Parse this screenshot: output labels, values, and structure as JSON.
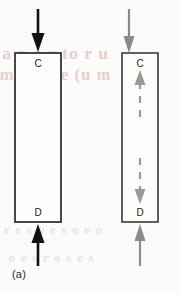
{
  "figure": {
    "background_color": "#fbfbfa",
    "panels": [
      {
        "id": "a",
        "caption": "(a)",
        "specimen": {
          "shape": "rectangle",
          "outline_color": "#1a1a1a",
          "fill_color": "#fdfdfc",
          "top_label": "C",
          "bottom_label": "D"
        },
        "load_arrows": [
          {
            "name": "top-load-arrow",
            "direction": "down",
            "color": "#111111",
            "style": "solid",
            "position": "above-specimen"
          },
          {
            "name": "bottom-load-arrow",
            "direction": "up",
            "color": "#111111",
            "style": "solid",
            "position": "below-specimen"
          }
        ],
        "internal_arrows": []
      },
      {
        "id": "b",
        "caption": "(b)",
        "specimen": {
          "shape": "rectangle",
          "outline_color": "#3a3a3a",
          "fill_color": "#fdfdfc",
          "top_label": "C",
          "bottom_label": "D"
        },
        "load_arrows": [
          {
            "name": "top-load-arrow",
            "direction": "down",
            "color": "#8a8a8a",
            "style": "solid",
            "position": "above-specimen"
          },
          {
            "name": "bottom-load-arrow",
            "direction": "up",
            "color": "#8a8a8a",
            "style": "solid",
            "position": "below-specimen"
          }
        ],
        "internal_arrows": [
          {
            "name": "upper-internal-dashed-arrow",
            "direction": "up",
            "color": "#9a9a9a",
            "style": "dashed",
            "position": "upper-interior"
          },
          {
            "name": "lower-internal-dashed-arrow",
            "direction": "down",
            "color": "#9a9a9a",
            "style": "dashed",
            "position": "lower-interior"
          }
        ]
      }
    ],
    "bleed_through_text": {
      "line1": "a p e r to r u",
      "line2": "m c a s e (u m",
      "line3": "r e  s o e  s o e  o",
      "line4": "o e s  r o s e  s"
    },
    "colors": {
      "ink_black": "#111111",
      "ink_gray": "#8a8a8a",
      "dashed_gray": "#9a9a9a",
      "paper": "#fbfbfa"
    }
  }
}
